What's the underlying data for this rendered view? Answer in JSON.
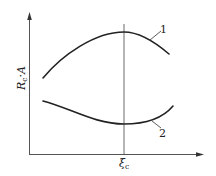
{
  "diagram": {
    "y_axis_label": "R",
    "y_axis_label_sub": "c",
    "y_axis_label_tail": "·A",
    "x_axis_tick_label": "ξ",
    "x_axis_tick_label_sub": "c",
    "curves": [
      {
        "id": "1",
        "label": "1",
        "shape": "concave, maximum at ξc"
      },
      {
        "id": "2",
        "label": "2",
        "shape": "convex, minimum at ξc"
      }
    ],
    "colors": {
      "line": "#222222",
      "axis": "#555555",
      "background": "#ffffff"
    }
  }
}
